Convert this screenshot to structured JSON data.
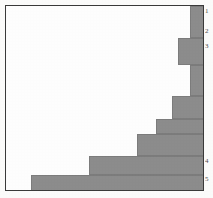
{
  "figure": {
    "name": "horizontal-bar-histogram",
    "background_color": "#ffffff",
    "frame_color": "#3a3a3a",
    "bar_color": "#8d8d8d"
  },
  "axis": {
    "right_tick_labels": [
      {
        "text": "1",
        "y": 8
      },
      {
        "text": "2",
        "y": 28
      },
      {
        "text": "3",
        "y": 43
      },
      {
        "text": "4",
        "y": 158
      },
      {
        "text": "5",
        "y": 176
      }
    ]
  },
  "chart_data": {
    "type": "bar",
    "title": "",
    "xlabel": "",
    "ylabel": "",
    "orientation": "horizontal",
    "grid": false,
    "legend": null,
    "categories": [
      "1",
      "2",
      "3",
      "4",
      "5",
      "6",
      "7",
      "8",
      "9",
      "10"
    ],
    "values": [
      99,
      92,
      82,
      73,
      63,
      46,
      38,
      32,
      19,
      0
    ],
    "xlim": [
      0,
      100
    ],
    "note": "Monotonically decreasing staircase: bars are drawn from the right edge leftwards, longest at top.",
    "bars": [
      {
        "category": "1",
        "value": 99,
        "x": 184,
        "y": 0,
        "w": 15,
        "h": 32
      },
      {
        "category": "2",
        "value": 92,
        "x": 172,
        "y": 32,
        "w": 27,
        "h": 27
      },
      {
        "category": "3",
        "value": 82,
        "x": 184,
        "y": 59,
        "w": 15,
        "h": 31
      },
      {
        "category": "4",
        "value": 73,
        "x": 166,
        "y": 90,
        "w": 33,
        "h": 23
      },
      {
        "category": "5",
        "value": 63,
        "x": 150,
        "y": 113,
        "w": 49,
        "h": 15
      },
      {
        "category": "6",
        "value": 46,
        "x": 131,
        "y": 128,
        "w": 68,
        "h": 22
      },
      {
        "category": "7",
        "value": 38,
        "x": 83,
        "y": 150,
        "w": 116,
        "h": 19
      },
      {
        "category": "8",
        "value": 19,
        "x": 25,
        "y": 169,
        "w": 174,
        "h": 17
      }
    ]
  }
}
